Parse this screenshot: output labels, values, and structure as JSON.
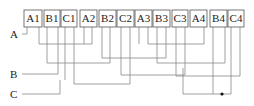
{
  "diagram": {
    "type": "wiring",
    "boxes": [
      {
        "label": "A1",
        "x": 24,
        "w": 18
      },
      {
        "label": "B1",
        "x": 44,
        "w": 16
      },
      {
        "label": "C1",
        "x": 61,
        "w": 16
      },
      {
        "label": "A2",
        "x": 80,
        "w": 17
      },
      {
        "label": "B2",
        "x": 99,
        "w": 17
      },
      {
        "label": "C2",
        "x": 117,
        "w": 17
      },
      {
        "label": "A3",
        "x": 135,
        "w": 17
      },
      {
        "label": "B3",
        "x": 153,
        "w": 17
      },
      {
        "label": "C3",
        "x": 172,
        "w": 16
      },
      {
        "label": "A4",
        "x": 190,
        "w": 17
      },
      {
        "label": "B4",
        "x": 210,
        "w": 17
      },
      {
        "label": "C4",
        "x": 228,
        "w": 16
      }
    ],
    "buses": [
      {
        "label": "A",
        "y": 34
      },
      {
        "label": "B",
        "y": 74
      },
      {
        "label": "C",
        "y": 94
      }
    ],
    "junction": {
      "x": 222,
      "y": 94
    }
  }
}
